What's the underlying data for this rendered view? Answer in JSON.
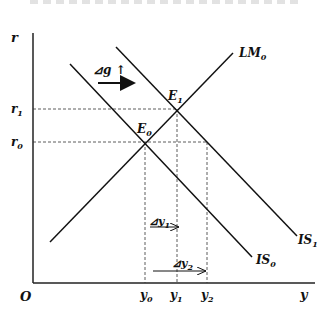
{
  "figure": {
    "type": "IS-LM diagram",
    "axes": {
      "y_axis_label": "r",
      "x_axis_label": "y",
      "origin_label": "O"
    },
    "interest_rate_ticks": [
      {
        "label": "r",
        "sub": "1",
        "y": 109
      },
      {
        "label": "r",
        "sub": "0",
        "y": 142
      }
    ],
    "output_ticks": [
      {
        "label": "y",
        "sub": "0",
        "x": 145
      },
      {
        "label": "y",
        "sub": "1",
        "x": 177
      },
      {
        "label": "y",
        "sub": "2",
        "x": 207
      }
    ],
    "curves": {
      "lm0": {
        "label": "LM",
        "sub": "0"
      },
      "is0": {
        "label": "IS",
        "sub": "0"
      },
      "is1": {
        "label": "IS",
        "sub": "1"
      }
    },
    "equilibria": {
      "e0": {
        "label": "E",
        "sub": "0"
      },
      "e1": {
        "label": "E",
        "sub": "1"
      }
    },
    "annotations": {
      "delta_g": {
        "text": "⊿g ↑"
      },
      "delta_y1": {
        "text": "⊿y",
        "sub": "1"
      },
      "delta_y2": {
        "text": "⊿y",
        "sub": "2"
      }
    },
    "colors": {
      "line": "#111111",
      "dashed": "#333333",
      "background": "#ffffff"
    }
  }
}
